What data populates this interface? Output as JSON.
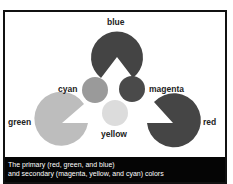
{
  "figure": {
    "labels": {
      "blue": "blue",
      "cyan": "cyan",
      "magenta": "magenta",
      "green": "green",
      "yellow": "yellow",
      "red": "red"
    },
    "shape_colors": {
      "blue": "#444444",
      "cyan": "#9a9a9a",
      "magenta": "#4a4a4a",
      "green": "#bdbdbd",
      "yellow": "#dcdcdc",
      "red": "#454545"
    },
    "caption": {
      "line1": "The primary (red, green, and blue)",
      "line2": "and secondary (magenta, yellow, and cyan) colors"
    }
  }
}
